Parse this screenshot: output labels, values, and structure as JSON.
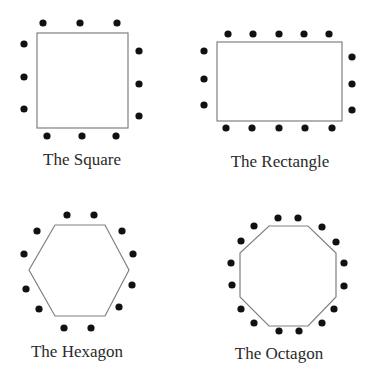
{
  "colors": {
    "outline": "#808080",
    "dot": "#111111",
    "text": "#2a2a2a"
  },
  "panels": [
    {
      "label": "The Square",
      "label_pos": [
        82,
        150
      ],
      "shape": {
        "type": "rect",
        "x": 37,
        "y": 33,
        "w": 91,
        "h": 95
      },
      "dots": [
        [
          43,
          23
        ],
        [
          80,
          23
        ],
        [
          117,
          23
        ],
        [
          24,
          44
        ],
        [
          24,
          77
        ],
        [
          24,
          109
        ],
        [
          139,
          51
        ],
        [
          139,
          84
        ],
        [
          139,
          116
        ],
        [
          47,
          136
        ],
        [
          82,
          136
        ],
        [
          116,
          136
        ]
      ]
    },
    {
      "label": "The Rectangle",
      "label_pos": [
        280,
        152
      ],
      "shape": {
        "type": "rect",
        "x": 217,
        "y": 42,
        "w": 125,
        "h": 79
      },
      "dots": [
        [
          228,
          34
        ],
        [
          253,
          34
        ],
        [
          279,
          34
        ],
        [
          304,
          34
        ],
        [
          329,
          34
        ],
        [
          204,
          51
        ],
        [
          204,
          79
        ],
        [
          204,
          105
        ],
        [
          352,
          57
        ],
        [
          352,
          84
        ],
        [
          352,
          110
        ],
        [
          226,
          128
        ],
        [
          252,
          128
        ],
        [
          279,
          128
        ],
        [
          305,
          128
        ],
        [
          332,
          128
        ]
      ]
    },
    {
      "label": "The Hexagon",
      "label_pos": [
        77,
        342
      ],
      "shape": {
        "type": "polygon",
        "points": [
          [
            55,
            225
          ],
          [
            105,
            225
          ],
          [
            129,
            270
          ],
          [
            105,
            316
          ],
          [
            55,
            316
          ],
          [
            29,
            270
          ]
        ]
      },
      "dots": [
        [
          67,
          215
        ],
        [
          94,
          215
        ],
        [
          37,
          231
        ],
        [
          122,
          231
        ],
        [
          24,
          254
        ],
        [
          133,
          254
        ],
        [
          26,
          289
        ],
        [
          132,
          285
        ],
        [
          39,
          309
        ],
        [
          119,
          307
        ],
        [
          64,
          328
        ],
        [
          91,
          328
        ]
      ]
    },
    {
      "label": "The Octagon",
      "label_pos": [
        279,
        344
      ],
      "shape": {
        "type": "polygon",
        "points": [
          [
            269,
            226
          ],
          [
            308,
            226
          ],
          [
            336,
            253
          ],
          [
            336,
            297
          ],
          [
            308,
            326
          ],
          [
            269,
            326
          ],
          [
            240,
            297
          ],
          [
            240,
            253
          ]
        ]
      },
      "dots": [
        [
          278,
          218
        ],
        [
          298,
          218
        ],
        [
          254,
          226
        ],
        [
          322,
          227
        ],
        [
          241,
          241
        ],
        [
          336,
          242
        ],
        [
          231,
          263
        ],
        [
          344,
          263
        ],
        [
          232,
          285
        ],
        [
          344,
          286
        ],
        [
          241,
          309
        ],
        [
          334,
          309
        ],
        [
          254,
          323
        ],
        [
          322,
          323
        ],
        [
          279,
          331
        ],
        [
          299,
          331
        ]
      ]
    }
  ]
}
